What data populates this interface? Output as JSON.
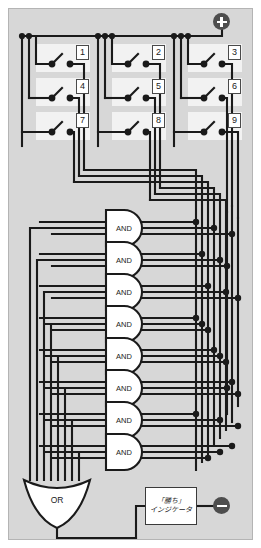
{
  "diagram": {
    "background_color": "#d7d7d7",
    "wire_color": "#1a1a1a",
    "panel_color": "#f2f2f2",
    "terminal_color": "#4d4d4d"
  },
  "power": {
    "positive": {
      "label": "+",
      "icon": "plus-terminal-icon",
      "x": 222,
      "y": 22
    },
    "negative": {
      "label": "−",
      "icon": "minus-terminal-icon",
      "x": 222,
      "y": 502
    }
  },
  "switches": [
    {
      "id": 1,
      "label": "1",
      "row": 0,
      "col": 0
    },
    {
      "id": 2,
      "label": "2",
      "row": 0,
      "col": 1
    },
    {
      "id": 3,
      "label": "3",
      "row": 0,
      "col": 2
    },
    {
      "id": 4,
      "label": "4",
      "row": 1,
      "col": 0
    },
    {
      "id": 5,
      "label": "5",
      "row": 1,
      "col": 1
    },
    {
      "id": 6,
      "label": "6",
      "row": 1,
      "col": 2
    },
    {
      "id": 7,
      "label": "7",
      "row": 2,
      "col": 0
    },
    {
      "id": 8,
      "label": "8",
      "row": 2,
      "col": 1
    },
    {
      "id": 9,
      "label": "9",
      "row": 2,
      "col": 2
    }
  ],
  "and_gates": [
    {
      "index": 1,
      "label": "AND",
      "inputs": [
        1,
        2,
        3
      ]
    },
    {
      "index": 2,
      "label": "AND",
      "inputs": [
        4,
        5,
        6
      ]
    },
    {
      "index": 3,
      "label": "AND",
      "inputs": [
        7,
        8,
        9
      ]
    },
    {
      "index": 4,
      "label": "AND",
      "inputs": [
        1,
        4,
        7
      ]
    },
    {
      "index": 5,
      "label": "AND",
      "inputs": [
        2,
        5,
        8
      ]
    },
    {
      "index": 6,
      "label": "AND",
      "inputs": [
        3,
        6,
        9
      ]
    },
    {
      "index": 7,
      "label": "AND",
      "inputs": [
        1,
        5,
        9
      ]
    },
    {
      "index": 8,
      "label": "AND",
      "inputs": [
        3,
        5,
        7
      ]
    }
  ],
  "or_gate": {
    "label": "OR",
    "inputs": 8
  },
  "indicator": {
    "line1": "「勝ち」",
    "line2": "インジケータ"
  }
}
